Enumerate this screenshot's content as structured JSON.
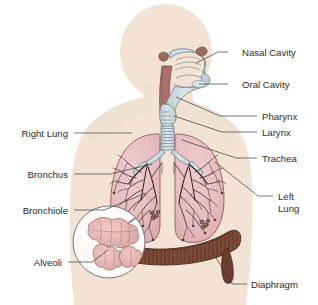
{
  "diagram": {
    "background_color": "#ffffff",
    "body_silhouette_color": "#f2e3d5",
    "body_silhouette_edge": "#e8d5c3",
    "lung_color": "#e8bfc2",
    "lung_edge": "#8c5a60",
    "airway_color": "#cdd9dd",
    "airway_edge": "#6d8086",
    "pharynx_color": "#a9706c",
    "diaphragm_color": "#7d4a38",
    "diaphragm_edge": "#4a2a1e",
    "alveoli_color": "#e6b4b2",
    "alveoli_edge": "#9a6a66",
    "bronchial_tree_color": "#3a2a26",
    "label_text_color": "#2b2b2b",
    "leader_line_color": "#3a3a3a"
  },
  "labels": {
    "right_side": [
      {
        "id": "nasal-cavity",
        "text": "Nasal Cavity",
        "text_x": 242,
        "text_y": 56,
        "anchor": "start",
        "line": "M 228 52 L 218 52 L 196 63"
      },
      {
        "id": "oral-cavity",
        "text": "Oral Cavity",
        "text_x": 242,
        "text_y": 88,
        "anchor": "start",
        "line": "M 228 84 L 216 84 L 199 84"
      },
      {
        "id": "pharynx",
        "text": "Pharynx",
        "text_x": 262,
        "text_y": 120,
        "anchor": "start",
        "line": "M 257 116 L 220 116 L 176 97"
      },
      {
        "id": "larynx",
        "text": "Larynx",
        "text_x": 262,
        "text_y": 136,
        "anchor": "start",
        "line": "M 257 132 L 222 132 L 174 116"
      },
      {
        "id": "trachea",
        "text": "Trachea",
        "text_x": 262,
        "text_y": 162,
        "anchor": "start",
        "line": "M 257 158 L 236 158 L 182 140"
      },
      {
        "id": "left-lung-1",
        "text": "Left",
        "text_x": 278,
        "text_y": 200,
        "anchor": "start",
        "line": "M 273 196 L 258 196 L 215 162"
      },
      {
        "id": "left-lung-2",
        "text": "Lung",
        "text_x": 278,
        "text_y": 212,
        "anchor": "start",
        "line": ""
      },
      {
        "id": "diaphragm",
        "text": "Diaphragm",
        "text_x": 251,
        "text_y": 288,
        "anchor": "start",
        "line": "M 247 284 L 232 284 L 210 248"
      }
    ],
    "left_side": [
      {
        "id": "right-lung",
        "text": "Right Lung",
        "text_x": 68,
        "text_y": 137,
        "anchor": "end",
        "line": "M 74 133 L 112 133 L 132 133"
      },
      {
        "id": "bronchus",
        "text": "Bronchus",
        "text_x": 68,
        "text_y": 178,
        "anchor": "end",
        "line": "M 74 174 L 110 174 L 152 164"
      },
      {
        "id": "bronchiole",
        "text": "Bronchiole",
        "text_x": 68,
        "text_y": 214,
        "anchor": "end",
        "line": "M 74 210 L 104 210 L 146 193"
      },
      {
        "id": "alveoli",
        "text": "Alveoli",
        "text_x": 62,
        "text_y": 266,
        "anchor": "end",
        "line": "M 68 262 L 92 262 L 108 250"
      }
    ]
  },
  "alveoli_inset": {
    "circle_cx": 109,
    "circle_cy": 242,
    "circle_r": 36
  }
}
